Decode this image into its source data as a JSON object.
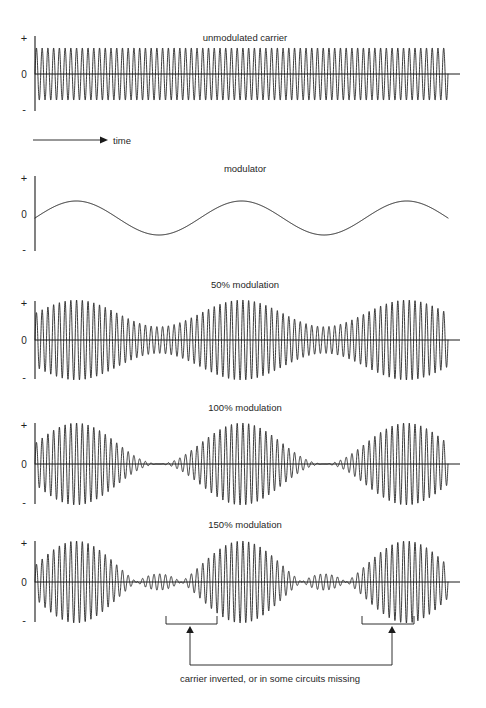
{
  "figure": {
    "background_color": "#ffffff",
    "stroke_color": "#1a1a1a",
    "width": 486,
    "height": 708
  },
  "axis": {
    "plus_label": "+",
    "zero_label": "0",
    "minus_label": "-"
  },
  "time_axis": {
    "label": "time"
  },
  "panels": [
    {
      "id": "unmodulated-carrier",
      "title": "unmodulated carrier"
    },
    {
      "id": "modulator",
      "title": "modulator"
    },
    {
      "id": "mod-50",
      "title": "50% modulation"
    },
    {
      "id": "mod-100",
      "title": "100% modulation"
    },
    {
      "id": "mod-150",
      "title": "150% modulation"
    }
  ],
  "annotation": {
    "caption": "carrier inverted, or in some circuits missing"
  },
  "chart_data": {
    "type": "line",
    "xlabel": "time",
    "ylabel": "",
    "ylim": [
      -1,
      1
    ],
    "grid": false,
    "legend": "none",
    "x_range": [
      0,
      1
    ],
    "carrier_cycles": 72,
    "modulator_cycles": 2.5,
    "modulator_phase_deg": 0,
    "series": [
      {
        "name": "unmodulated carrier",
        "panel": "unmodulated-carrier",
        "modulation_index": 0,
        "description": "constant-amplitude sinusoidal carrier",
        "envelope_peak": 1.0,
        "envelope_min": 1.0,
        "yticks": [
          "+",
          "0",
          "-"
        ]
      },
      {
        "name": "modulator",
        "panel": "modulator",
        "description": "low-frequency sinusoid, 2.5 cycles, starting at zero rising",
        "amplitude": 0.35,
        "cycles": 2.5,
        "yticks": [
          "+",
          "0",
          "-"
        ]
      },
      {
        "name": "50% modulation",
        "panel": "mod-50",
        "modulation_index": 0.5,
        "envelope_peak": 1.5,
        "envelope_min": 0.5,
        "description": "envelope varies between 50% and 150% of carrier amplitude",
        "yticks": [
          "+",
          "0",
          "-"
        ]
      },
      {
        "name": "100% modulation",
        "panel": "mod-100",
        "modulation_index": 1.0,
        "envelope_peak": 2.0,
        "envelope_min": 0.0,
        "description": "envelope just reaches zero at troughs",
        "yticks": [
          "+",
          "0",
          "-"
        ]
      },
      {
        "name": "150% modulation",
        "panel": "mod-150",
        "modulation_index": 1.5,
        "envelope_peak": 2.5,
        "envelope_min": -0.5,
        "description": "overmodulation: envelope goes negative, carrier inverts or is clipped",
        "overmodulated_regions": [
          {
            "label": "carrier inverted, or in some circuits missing",
            "x_center": 0.38
          },
          {
            "label": "carrier inverted, or in some circuits missing",
            "x_center": 0.87
          }
        ],
        "yticks": [
          "+",
          "0",
          "-"
        ]
      }
    ]
  }
}
